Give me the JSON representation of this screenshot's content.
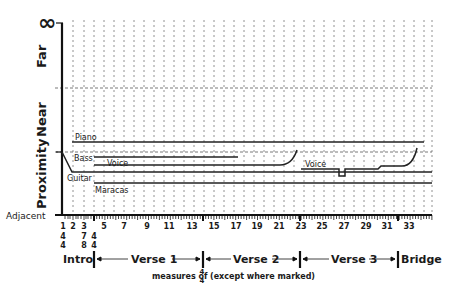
{
  "chart_data": {
    "type": "line",
    "title": "",
    "xlabel": "measures of 4/4 (except where marked)",
    "ylabel": "Proximity",
    "y_regions": [
      "Adjacent",
      "Proximity",
      "Near",
      "Far",
      "∞"
    ],
    "y_region_labels": {
      "infinity": "∞",
      "far": "Far",
      "near": "Near",
      "proximity": "Proximity",
      "adjacent": "Adjacent"
    },
    "x_tick_labels": [
      "1",
      "2",
      "3",
      "5",
      "7",
      "9",
      "11",
      "13",
      "15",
      "17",
      "19",
      "21",
      "23",
      "25",
      "27",
      "29",
      "31",
      "33"
    ],
    "time_signatures": [
      {
        "measure": 1,
        "top": "4",
        "bottom": "4"
      },
      {
        "measure": 3,
        "top": "7",
        "bottom": "8"
      },
      {
        "measure": 4,
        "top": "4",
        "bottom": "4"
      }
    ],
    "sections": [
      {
        "label": "Intro",
        "start": 1,
        "end": 4
      },
      {
        "label": "Verse 1",
        "start": 4,
        "end": 14
      },
      {
        "label": "Verse 2",
        "start": 14,
        "end": 23
      },
      {
        "label": "Verse 3",
        "start": 23,
        "end": 34
      },
      {
        "label": "Bridge",
        "start": 34,
        "end": 35
      }
    ],
    "series": [
      {
        "name": "Piano",
        "start": 2,
        "end": 35,
        "level": "near-low"
      },
      {
        "name": "Bass",
        "start": 4,
        "end": 17,
        "level": "proximity-high"
      },
      {
        "name": "Voice",
        "start": 4,
        "end": 23,
        "level": "proximity-mid",
        "note": "rises toward Near at end of Verse 2"
      },
      {
        "name": "Voice",
        "start": 24,
        "end": 34,
        "level": "proximity-mid",
        "note": "dip at m.27, step up at m.30, rises to Near at m.34"
      },
      {
        "name": "Guitar",
        "start": 1,
        "end": 35,
        "level": "proximity-mid-low",
        "note": "enters from Near boundary descending into Proximity"
      },
      {
        "name": "Maracas",
        "start": 4,
        "end": 35,
        "level": "proximity-low"
      }
    ]
  },
  "labels": {
    "infinity": "∞",
    "far": "Far",
    "near": "Near",
    "proximity": "Proximity",
    "adjacent": "Adjacent",
    "piano": "Piano",
    "bass": "Bass",
    "voice1": "Voice",
    "voice2": "Voice",
    "guitar": "Guitar",
    "maracas": "Maracas",
    "measures_of": "measures of",
    "ts_top": "4",
    "ts_bottom": "4",
    "except": "(except where marked)",
    "intro": "Intro",
    "verse1": "Verse 1",
    "verse2": "Verse 2",
    "verse3": "Verse 3",
    "bridge": "Bridge",
    "tick_1": "1",
    "tick_2": "2",
    "tick_3": "3",
    "tick_5": "5",
    "tick_7": "7",
    "tick_9": "9",
    "tick_11": "11",
    "tick_13": "13",
    "tick_15": "15",
    "tick_17": "17",
    "tick_19": "19",
    "tick_21": "21",
    "tick_23": "23",
    "tick_25": "25",
    "tick_27": "27",
    "tick_29": "29",
    "tick_31": "31",
    "tick_33": "33",
    "ts1_top": "4",
    "ts1_bot": "4",
    "ts3_top": "7",
    "ts3_bot": "8",
    "ts4_top": "4",
    "ts4_bot": "4"
  }
}
